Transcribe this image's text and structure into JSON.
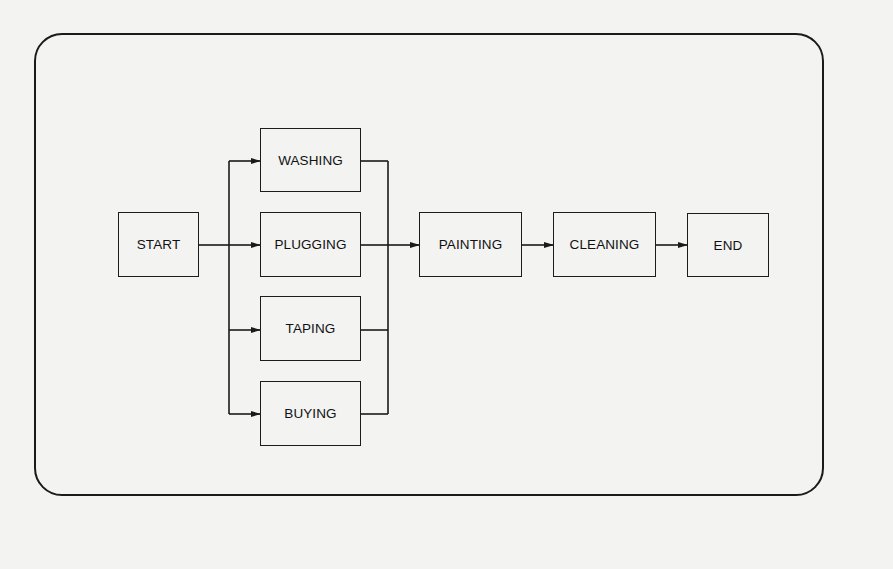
{
  "diagram": {
    "type": "flowchart",
    "nodes": {
      "start": "START",
      "washing": "WASHING",
      "plugging": "PLUGGING",
      "taping": "TAPING",
      "buying": "BUYING",
      "painting": "PAINTING",
      "cleaning": "CLEANING",
      "end": "END"
    },
    "edges": [
      [
        "START",
        "WASHING"
      ],
      [
        "START",
        "PLUGGING"
      ],
      [
        "START",
        "TAPING"
      ],
      [
        "START",
        "BUYING"
      ],
      [
        "WASHING",
        "PAINTING"
      ],
      [
        "PLUGGING",
        "PAINTING"
      ],
      [
        "TAPING",
        "PAINTING"
      ],
      [
        "BUYING",
        "PAINTING"
      ],
      [
        "PAINTING",
        "CLEANING"
      ],
      [
        "CLEANING",
        "END"
      ]
    ],
    "colors": {
      "line": "#1a1a1a",
      "background": "#f3f3f1"
    }
  }
}
